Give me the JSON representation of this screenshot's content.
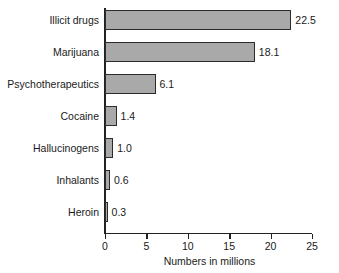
{
  "chart_data": {
    "type": "bar",
    "orientation": "horizontal",
    "title": "",
    "xlabel": "Numbers in millions",
    "ylabel": "",
    "xlim": [
      0,
      25
    ],
    "xticks": [
      0,
      5,
      10,
      15,
      20,
      25
    ],
    "xtick_labels": [
      "0",
      "5",
      "10",
      "15",
      "20",
      "25"
    ],
    "grid": false,
    "legend": null,
    "categories": [
      "Illicit drugs",
      "Marijuana",
      "Psychotherapeutics",
      "Cocaine",
      "Hallucinogens",
      "Inhalants",
      "Heroin"
    ],
    "values": [
      22.5,
      18.1,
      6.1,
      1.4,
      1.0,
      0.6,
      0.3
    ],
    "value_labels": [
      "22.5",
      "18.1",
      "6.1",
      "1.4",
      "1.0",
      "0.6",
      "0.3"
    ],
    "bar_color": "#a9a9a9",
    "bar_border_color": "#2b2b2b",
    "axis_color": "#222222",
    "background_color": "#ffffff",
    "text_color": "#1a1a1a"
  }
}
